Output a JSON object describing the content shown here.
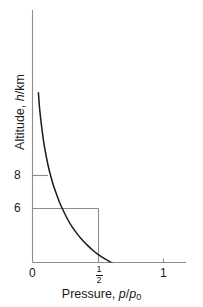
{
  "chart_data": {
    "type": "line",
    "title": "",
    "xlabel": "Pressure, p/p0",
    "ylabel": "Altitude, h/km",
    "xlabel_parts": {
      "text": "Pressure, ",
      "var1": "p",
      "slash": "/",
      "var2": "p",
      "sub": "0"
    },
    "ylabel_parts": {
      "text": "Altitude, ",
      "var1": "h",
      "rest": "/km"
    },
    "xlim": [
      0,
      1.14
    ],
    "ylim": [
      0,
      19.4
    ],
    "grid": false,
    "legend": null,
    "xticks": [
      {
        "value": 0,
        "label": "0"
      },
      {
        "value": 0.5,
        "label": "1/2",
        "numerator": "1",
        "denominator": "2"
      },
      {
        "value": 1,
        "label": "1"
      }
    ],
    "yticks": [
      {
        "value": 8,
        "label": "8",
        "gridline": false
      },
      {
        "value": 6,
        "label": "6",
        "gridline": true
      }
    ],
    "annotations": [
      {
        "name": "half-pressure-gridline",
        "from": [
          0,
          6
        ],
        "to": [
          0.5,
          6
        ]
      },
      {
        "name": "half-pressure-dropline",
        "from": [
          0.5,
          6
        ],
        "to": [
          0.5,
          0
        ]
      }
    ],
    "series": [
      {
        "name": "barometric-decay",
        "color": "#1a1a1a",
        "x": [
          0.0452,
          0.05,
          0.055,
          0.062,
          0.07,
          0.08,
          0.092,
          0.105,
          0.12,
          0.14,
          0.16,
          0.185,
          0.21,
          0.24,
          0.27,
          0.3,
          0.34,
          0.38,
          0.42,
          0.46,
          0.5,
          0.55,
          0.6,
          0.65,
          0.7,
          0.75,
          0.8,
          0.86,
          0.92,
          0.96,
          1.0
        ],
        "y": [
          18.85,
          17.85,
          17.02,
          16.01,
          15.07,
          13.94,
          12.82,
          11.79,
          10.72,
          9.55,
          8.55,
          7.52,
          6.56,
          5.61,
          4.75,
          4.02,
          3.21,
          2.5,
          1.9,
          1.36,
          0.9,
          0.42,
          0.02,
          -0.32,
          -0.62,
          -0.88,
          -1.11,
          -1.35,
          -1.55,
          -1.67,
          -1.78
        ]
      }
    ]
  },
  "axes_style": {
    "axis_color": "#8c8c8c",
    "grid_color": "#8c8c8c",
    "curve_color": "#1a1a1a",
    "background": "#ffffff"
  }
}
